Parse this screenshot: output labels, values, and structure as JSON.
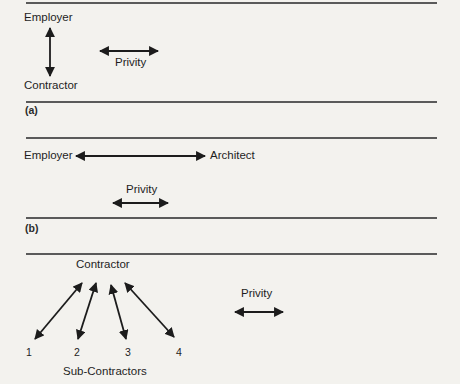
{
  "figure": {
    "panel_a": {
      "caption": "(a)",
      "top_node": "Employer",
      "bottom_node": "Contractor",
      "legend_label": "Privity"
    },
    "panel_b": {
      "caption": "(b)",
      "left_node": "Employer",
      "right_node": "Architect",
      "legend_label": "Privity"
    },
    "panel_c": {
      "top_node": "Contractor",
      "sub_nodes": [
        "1",
        "2",
        "3",
        "4"
      ],
      "group_label": "Sub-Contractors",
      "legend_label": "Privity"
    }
  },
  "colors": {
    "paper": "#f3f2ee",
    "ink": "#1c1c1c",
    "rule": "#5a5a5a"
  }
}
